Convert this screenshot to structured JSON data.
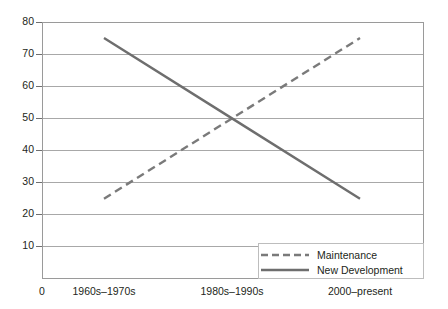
{
  "chart_data": {
    "type": "line",
    "title": "",
    "xlabel": "",
    "ylabel": "",
    "categories": [
      "1960s–1970s",
      "1980s–1990s",
      "2000–present"
    ],
    "series": [
      {
        "name": "Maintenance",
        "values": [
          25,
          50,
          75
        ],
        "style": "dashed",
        "color": "#7a7a7a"
      },
      {
        "name": "New Development",
        "values": [
          75,
          50,
          25
        ],
        "style": "solid",
        "color": "#6e6e6e"
      }
    ],
    "ylim": [
      0,
      80
    ],
    "yticks": [
      10,
      20,
      30,
      40,
      50,
      60,
      70,
      80
    ],
    "ytick_labels": [
      "10",
      "20",
      "30",
      "40",
      "50",
      "60",
      "70",
      "80"
    ],
    "origin_label": "0",
    "grid": true,
    "legend_position": "bottom-right",
    "colors": {
      "grid": "#a8a8a8",
      "frame": "#9a9a9a",
      "text": "#231f20",
      "maintenance": "#7a7a7a",
      "new_development": "#6e6e6e",
      "background": "#ffffff"
    }
  },
  "legend": {
    "items": [
      {
        "label": "Maintenance",
        "marker": "dashed-line-icon"
      },
      {
        "label": "New Development",
        "marker": "solid-line-icon"
      }
    ]
  }
}
